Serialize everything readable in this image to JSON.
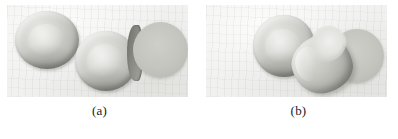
{
  "figure": {
    "panels": [
      {
        "label": "(a)",
        "name": "panel-a",
        "description": "scanning electron micrograph of three normal biconcave red blood cells",
        "background_color": "#f1f1ef",
        "cells": [
          {
            "name": "normal-rbc-left",
            "type": "biconcave-disc"
          },
          {
            "name": "normal-rbc-middle",
            "type": "biconcave-disc"
          },
          {
            "name": "normal-rbc-right",
            "type": "flat-disc-edge-on"
          }
        ]
      },
      {
        "label": "(b)",
        "name": "panel-b",
        "description": "scanning electron micrograph showing a sickled red blood cell among normal cells",
        "background_color": "#f1f1ef",
        "cells": [
          {
            "name": "normal-rbc-upper-left",
            "type": "biconcave-disc"
          },
          {
            "name": "sickled-rbc",
            "type": "crescent"
          },
          {
            "name": "normal-rbc-right",
            "type": "flat-disc-edge-on"
          }
        ]
      }
    ],
    "colors": {
      "page_background": "#ffffff",
      "photo_background": "#f1f1ef",
      "cell_light": "#e6e6e3",
      "cell_mid": "#bdbdb8",
      "cell_dark": "#8e8e88",
      "caption_text": "#1a1a1a"
    }
  }
}
